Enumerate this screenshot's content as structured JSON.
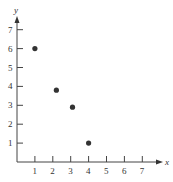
{
  "chart_data": {
    "type": "scatter",
    "title": "",
    "xlabel": "x",
    "ylabel": "y",
    "xlim": [
      0,
      7.5
    ],
    "ylim": [
      0,
      7.5
    ],
    "grid": false,
    "x_ticks": [
      "1",
      "2",
      "3",
      "4",
      "5",
      "6",
      "7"
    ],
    "y_ticks": [
      "1",
      "2",
      "3",
      "4",
      "5",
      "6",
      "7"
    ],
    "series": [
      {
        "name": "points",
        "points": [
          {
            "x": 1,
            "y": 6
          },
          {
            "x": 2.2,
            "y": 3.8
          },
          {
            "x": 3.1,
            "y": 2.9
          },
          {
            "x": 4,
            "y": 1
          }
        ]
      }
    ],
    "colors": {
      "axis": "#444444",
      "point": "#333333"
    }
  }
}
